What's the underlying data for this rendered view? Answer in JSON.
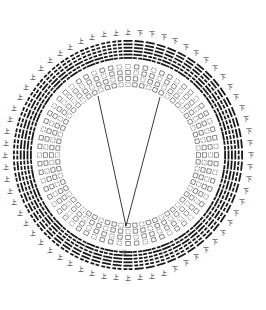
{
  "diagram": {
    "type": "circular hexagram diagram",
    "center": [
      128,
      155
    ],
    "outer_radius": 128,
    "inner_radius": 66,
    "hexagram_count": 64,
    "ring_colors": {
      "ink": "#1a1a1a",
      "paper": "#ffffff"
    },
    "outer_marks": {
      "upper": "上",
      "lower": "下"
    },
    "visible_labels": {
      "bottom": "復"
    },
    "center_lines": {
      "apex": [
        126,
        226
      ],
      "left_end": [
        98,
        96
      ],
      "right_end": [
        160,
        97
      ]
    }
  }
}
